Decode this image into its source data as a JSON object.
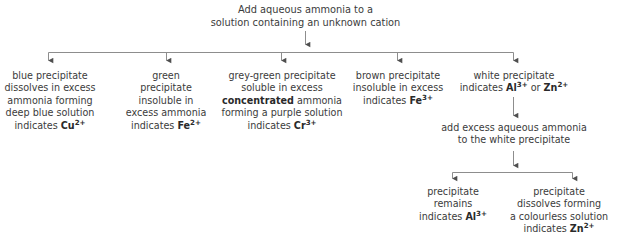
{
  "diagram": {
    "title_node": {
      "lines": [
        "Add aqueous ammonia to a",
        "solution containing an unknown cation"
      ]
    },
    "branches": [
      {
        "id": "copper",
        "lines": [
          {
            "text": "blue precipitate"
          },
          {
            "text": "dissolves in excess"
          },
          {
            "text": "ammonia forming"
          },
          {
            "text": "deep blue solution"
          },
          {
            "prefix": "indicates ",
            "bold": "Cu",
            "sup": "2+"
          }
        ]
      },
      {
        "id": "iron-two",
        "lines": [
          {
            "text": "green"
          },
          {
            "text": "precipitate"
          },
          {
            "text": "insoluble in"
          },
          {
            "text": "excess ammonia"
          },
          {
            "prefix": "indicates ",
            "bold": "Fe",
            "sup": "2+"
          }
        ]
      },
      {
        "id": "chromium",
        "lines": [
          {
            "text": "grey-green precipitate"
          },
          {
            "text": "soluble in excess"
          },
          {
            "bold_lead": "concentrated",
            "suffix": " ammonia"
          },
          {
            "text": "forming a purple solution"
          },
          {
            "prefix": "indicates ",
            "bold": "Cr",
            "sup": "3+"
          }
        ]
      },
      {
        "id": "iron-three",
        "lines": [
          {
            "text": "brown precipitate"
          },
          {
            "text": "insoluble in excess"
          },
          {
            "prefix": "indicates ",
            "bold": "Fe",
            "sup": "3+"
          }
        ]
      },
      {
        "id": "aluminium-or-zinc",
        "lines": [
          {
            "text": "white precipitate"
          },
          {
            "prefix": "indicates ",
            "bold": "Al",
            "sup": "3+",
            "mid": " or ",
            "bold2": "Zn",
            "sup2": "2+"
          }
        ]
      }
    ],
    "sub_step": {
      "lines": [
        "add excess aqueous ammonia",
        "to the white precipitate"
      ]
    },
    "sub_branches": [
      {
        "id": "aluminium",
        "lines": [
          {
            "text": "precipitate"
          },
          {
            "text": "remains"
          },
          {
            "prefix": "indicates ",
            "bold": "Al",
            "sup": "3+"
          }
        ]
      },
      {
        "id": "zinc",
        "lines": [
          {
            "text": "precipitate"
          },
          {
            "text": "dissolves forming"
          },
          {
            "text": "a colourless solution"
          },
          {
            "prefix": "indicates ",
            "bold": "Zn",
            "sup": "2+"
          }
        ]
      }
    ],
    "colors": {
      "text": "#3b3b3b",
      "bold_text": "#2a2a2a",
      "connector": "#8d8d8d",
      "arrow": "#555555",
      "background": "#ffffff"
    }
  }
}
